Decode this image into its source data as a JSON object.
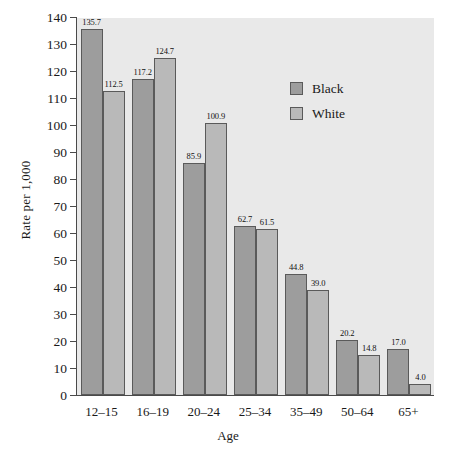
{
  "chart_data": {
    "type": "bar",
    "title": "",
    "subtitle": "",
    "xlabel": "Age",
    "ylabel": "Rate per 1,000",
    "categories": [
      "12–15",
      "16–19",
      "20–24",
      "25–34",
      "35–49",
      "50–64",
      "65+"
    ],
    "series": [
      {
        "name": "Black",
        "color": "#9d9d9d",
        "values": [
          135.7,
          117.2,
          85.9,
          62.7,
          44.8,
          20.2,
          17.0
        ],
        "labels": [
          "135.7",
          "117.2",
          "85.9",
          "62.7",
          "44.8",
          "20.2",
          "17.0"
        ]
      },
      {
        "name": "White",
        "color": "#b9b9b9",
        "values": [
          112.5,
          124.7,
          100.9,
          61.5,
          39.0,
          14.8,
          4.0
        ],
        "labels": [
          "112.5",
          "124.7",
          "100.9",
          "61.5",
          "39.0",
          "14.8",
          "4.0"
        ]
      }
    ],
    "ylim": [
      0,
      140
    ],
    "ytick_step": 10,
    "yticks": [
      0,
      10,
      20,
      30,
      40,
      50,
      60,
      70,
      80,
      90,
      100,
      110,
      120,
      130,
      140
    ],
    "ytick_labels": [
      "0",
      "10",
      "20",
      "30",
      "40",
      "50",
      "60",
      "70",
      "80",
      "90",
      "100",
      "110",
      "120",
      "130",
      "140"
    ],
    "grid": false,
    "legend_position": "upper-right-inside",
    "plot_background": "#e9e9e9",
    "axis_color": "#4a4a4a",
    "bar_edge_color": "#5a5a5a",
    "value_labels_shown": true
  },
  "legend": {
    "entries": [
      {
        "label": "Black",
        "color": "#9d9d9d"
      },
      {
        "label": "White",
        "color": "#b9b9b9"
      }
    ]
  }
}
